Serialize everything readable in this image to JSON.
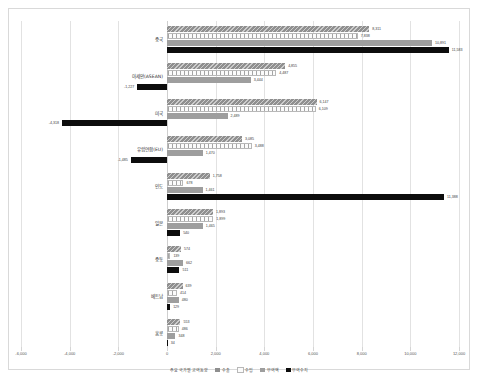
{
  "chart": {
    "title": "",
    "axis_min": -6000,
    "axis_max": 12000,
    "tick_step": 2000,
    "tick_labels": [
      "-6,000",
      "-4,000",
      "-2,000",
      "0",
      "2,000",
      "4,000",
      "6,000",
      "8,000",
      "10,000",
      "12,000"
    ],
    "legend_title": "주요 국가별 교역동향",
    "colors": {
      "export": "#8f8f8f",
      "import": "#fbfbfb",
      "total": "#9e9e9e",
      "balance": "#0d0d0d"
    }
  },
  "chart_data": {
    "type": "bar",
    "orientation": "horizontal",
    "title": "주요 국가별 교역동향",
    "xlabel": "",
    "ylabel": "",
    "xlim": [
      -6000,
      12000
    ],
    "grid": true,
    "legend_position": "bottom",
    "categories": [
      "중국",
      "아세안(ASEAN)",
      "미국",
      "유럽연합(EU)",
      "인도",
      "일본",
      "중동",
      "베트남",
      "홍콩"
    ],
    "series": [
      {
        "name": "수출",
        "values": [
          8311,
          4855,
          6147,
          3085,
          1758,
          1893,
          574,
          639,
          553
        ]
      },
      {
        "name": "수입",
        "values": [
          7838,
          4487,
          6109,
          3488,
          678,
          1899,
          139,
          414,
          486
        ]
      },
      {
        "name": "무역액",
        "values": [
          10891,
          3444,
          2489,
          1470,
          1461,
          1465,
          662,
          480,
          348
        ]
      },
      {
        "name": "무역수지",
        "values": [
          11583,
          -1227,
          -4318,
          -1485,
          11388,
          540,
          511,
          129,
          34
        ]
      }
    ],
    "value_labels": [
      [
        "8,311",
        "7,838",
        "10,891",
        "11,583"
      ],
      [
        "4,855",
        "4,487",
        "3,444",
        "-1,227"
      ],
      [
        "6,147",
        "6,109",
        "2,489",
        "-4,318"
      ],
      [
        "3,085",
        "3,488",
        "1,470",
        "-1,485"
      ],
      [
        "1,758",
        "678",
        "1,461",
        "11,388"
      ],
      [
        "1,893",
        "1,899",
        "1,465",
        "540"
      ],
      [
        "574",
        "139",
        "662",
        "511"
      ],
      [
        "639",
        "414",
        "480",
        "129"
      ],
      [
        "553",
        "486",
        "348",
        "34"
      ]
    ]
  }
}
